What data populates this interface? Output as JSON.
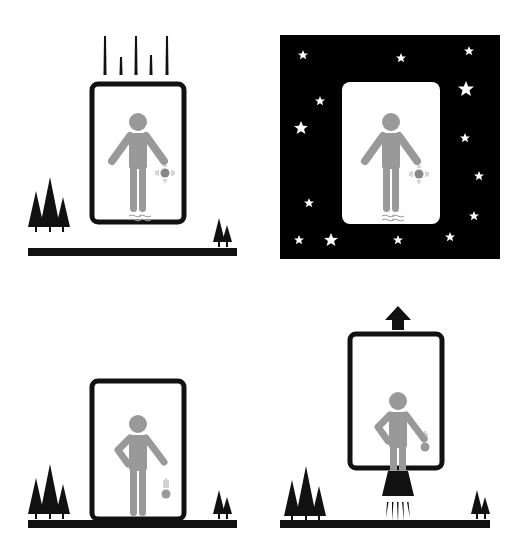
{
  "colors": {
    "ink": "#111111",
    "figure": "#999999",
    "space": "#000000",
    "star": "#ffffff",
    "background": "#ffffff"
  },
  "panels": [
    {
      "id": "top-left",
      "label": "Elevator in free fall on Earth",
      "scene": "falling elevator",
      "ball": "floating",
      "motion": "falling"
    },
    {
      "id": "top-right",
      "label": "Elevator floating in space",
      "scene": "deep space",
      "ball": "floating",
      "motion": "none"
    },
    {
      "id": "bottom-left",
      "label": "Elevator at rest on Earth",
      "scene": "ground",
      "ball": "falling",
      "motion": "rest"
    },
    {
      "id": "bottom-right",
      "label": "Elevator accelerating upward",
      "scene": "rocket thrust",
      "ball": "falling",
      "motion": "up-arrow"
    }
  ]
}
